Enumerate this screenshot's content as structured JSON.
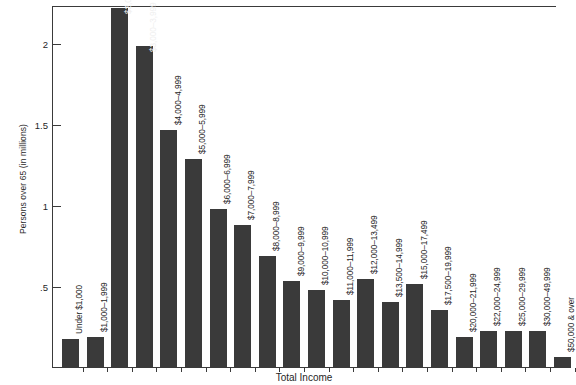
{
  "chart_data": {
    "type": "bar",
    "title": "",
    "xlabel": "Total Income",
    "ylabel": "Persons over 65 (in millions)",
    "ylim": [
      0,
      2.24
    ],
    "yticks": [
      0.5,
      1,
      1.5,
      2
    ],
    "ytick_labels": [
      ".5",
      "1",
      "1.5",
      "2"
    ],
    "grid": false,
    "legend": null,
    "bar_color": "#3a3a3a",
    "categories": [
      "Under $1,000",
      "$1,000–1,999",
      "$2,000–2,999",
      "$3,000–3,999",
      "$4,000–4,999",
      "$5,000–5,999",
      "$6,000–6,999",
      "$7,000–7,999",
      "$8,000–8,999",
      "$9,000–9,999",
      "$10,000–10,999",
      "$11,000–11,999",
      "$12,000–13,499",
      "$13,500–14,999",
      "$15,000–17,499",
      "$17,500–19,999",
      "$20,000–21,999",
      "$22,000–24,999",
      "$25,000–29,999",
      "$30,000–49,999",
      "$50,000 & over"
    ],
    "values": [
      0.18,
      0.19,
      2.22,
      1.99,
      1.47,
      1.29,
      0.98,
      0.88,
      0.69,
      0.54,
      0.48,
      0.42,
      0.55,
      0.41,
      0.52,
      0.36,
      0.19,
      0.23,
      0.23,
      0.23,
      0.07
    ],
    "label_placement": [
      "outside",
      "outside",
      "inside",
      "inside",
      "outside",
      "outside",
      "outside",
      "outside",
      "outside",
      "outside",
      "outside",
      "outside",
      "outside",
      "outside",
      "outside",
      "outside",
      "outside",
      "outside",
      "outside",
      "outside",
      "outside"
    ]
  }
}
